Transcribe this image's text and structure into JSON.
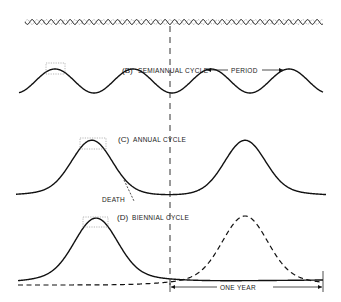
{
  "diagram": {
    "top_wave": {
      "label": "",
      "style": "rapid oscillation"
    },
    "panels": [
      {
        "id": "B",
        "prefix": "(B)",
        "title": "SEMIANNUAL  CYCLE",
        "annotation": "PERIOD",
        "peaks_per_year": 2
      },
      {
        "id": "C",
        "prefix": "(C)",
        "title": "ANNUAL CYCLE",
        "annotation": "DEATH",
        "peaks_per_year": 1
      },
      {
        "id": "D",
        "prefix": "(D)",
        "title": "BIENNIAL CYCLE",
        "annotation": "ONE  YEAR",
        "peaks_per_year": 0.5
      }
    ]
  }
}
